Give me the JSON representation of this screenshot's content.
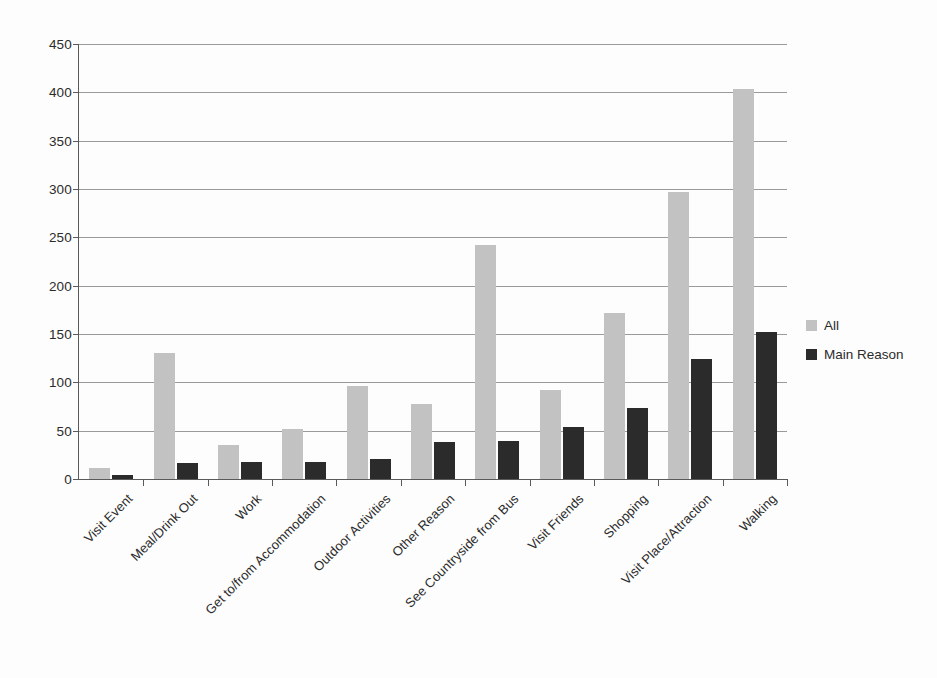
{
  "chart_data": {
    "type": "bar",
    "title": "",
    "subtitle": "",
    "xlabel": "",
    "ylabel": "",
    "ylim": [
      0,
      450
    ],
    "ytick_step": 50,
    "yticks": [
      0,
      50,
      100,
      150,
      200,
      250,
      300,
      350,
      400,
      450
    ],
    "grid": true,
    "legend_position": "right",
    "categories": [
      "Visit Event",
      "Meal/Drink Out",
      "Work",
      "Get to/from Accommodation",
      "Outdoor Activities",
      "Other Reason",
      "See Countryside from Bus",
      "Visit Friends",
      "Shopping",
      "Visit Place/Attraction",
      "Walking"
    ],
    "series": [
      {
        "name": "All",
        "color": "#c2c2c2",
        "values": [
          11,
          130,
          35,
          52,
          96,
          78,
          242,
          92,
          172,
          297,
          403
        ]
      },
      {
        "name": "Main Reason",
        "color": "#2b2b2b",
        "values": [
          4,
          17,
          18,
          18,
          21,
          38,
          39,
          54,
          73,
          124,
          152
        ]
      }
    ]
  },
  "legend": {
    "items": [
      {
        "label": "All",
        "color": "#c2c2c2"
      },
      {
        "label": "Main Reason",
        "color": "#2b2b2b"
      }
    ]
  },
  "axis": {
    "y_tick_labels": [
      "450",
      "400",
      "350",
      "300",
      "250",
      "200",
      "150",
      "100",
      "50",
      "0"
    ]
  }
}
